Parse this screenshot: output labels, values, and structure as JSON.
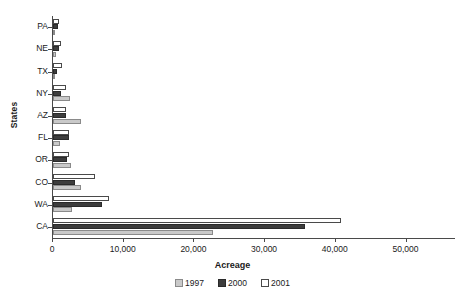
{
  "chart_data": {
    "type": "bar",
    "orientation": "horizontal",
    "title": "",
    "xlabel": "Acreage",
    "ylabel": "States",
    "categories": [
      "PA",
      "NE",
      "TX",
      "NY",
      "AZ",
      "FL",
      "OR",
      "CO",
      "WA",
      "CA"
    ],
    "series": [
      {
        "name": "1997",
        "color": "#c9c9c9",
        "values": [
          300,
          400,
          200,
          2400,
          3900,
          1000,
          2500,
          4000,
          2700,
          22600
        ]
      },
      {
        "name": "2000",
        "color": "#3d3d3d",
        "values": [
          700,
          800,
          500,
          1100,
          1900,
          2200,
          2000,
          3100,
          7000,
          35700
        ]
      },
      {
        "name": "2001",
        "color": "#ffffff",
        "values": [
          900,
          1100,
          1300,
          1900,
          1800,
          2300,
          2300,
          5900,
          7900,
          40800
        ]
      }
    ],
    "xlim": [
      0,
      57000
    ],
    "xticks": [
      0,
      10000,
      20000,
      30000,
      40000,
      50000
    ],
    "xticklabels": [
      "0",
      "10,000",
      "20,000",
      "30,000",
      "40,000",
      "50,000"
    ],
    "grid": false,
    "legend": {
      "position": "bottom",
      "entries": [
        {
          "label": "1997",
          "color": "#c9c9c9"
        },
        {
          "label": "2000",
          "color": "#3d3d3d"
        },
        {
          "label": "2001",
          "color": "#ffffff"
        }
      ]
    }
  }
}
